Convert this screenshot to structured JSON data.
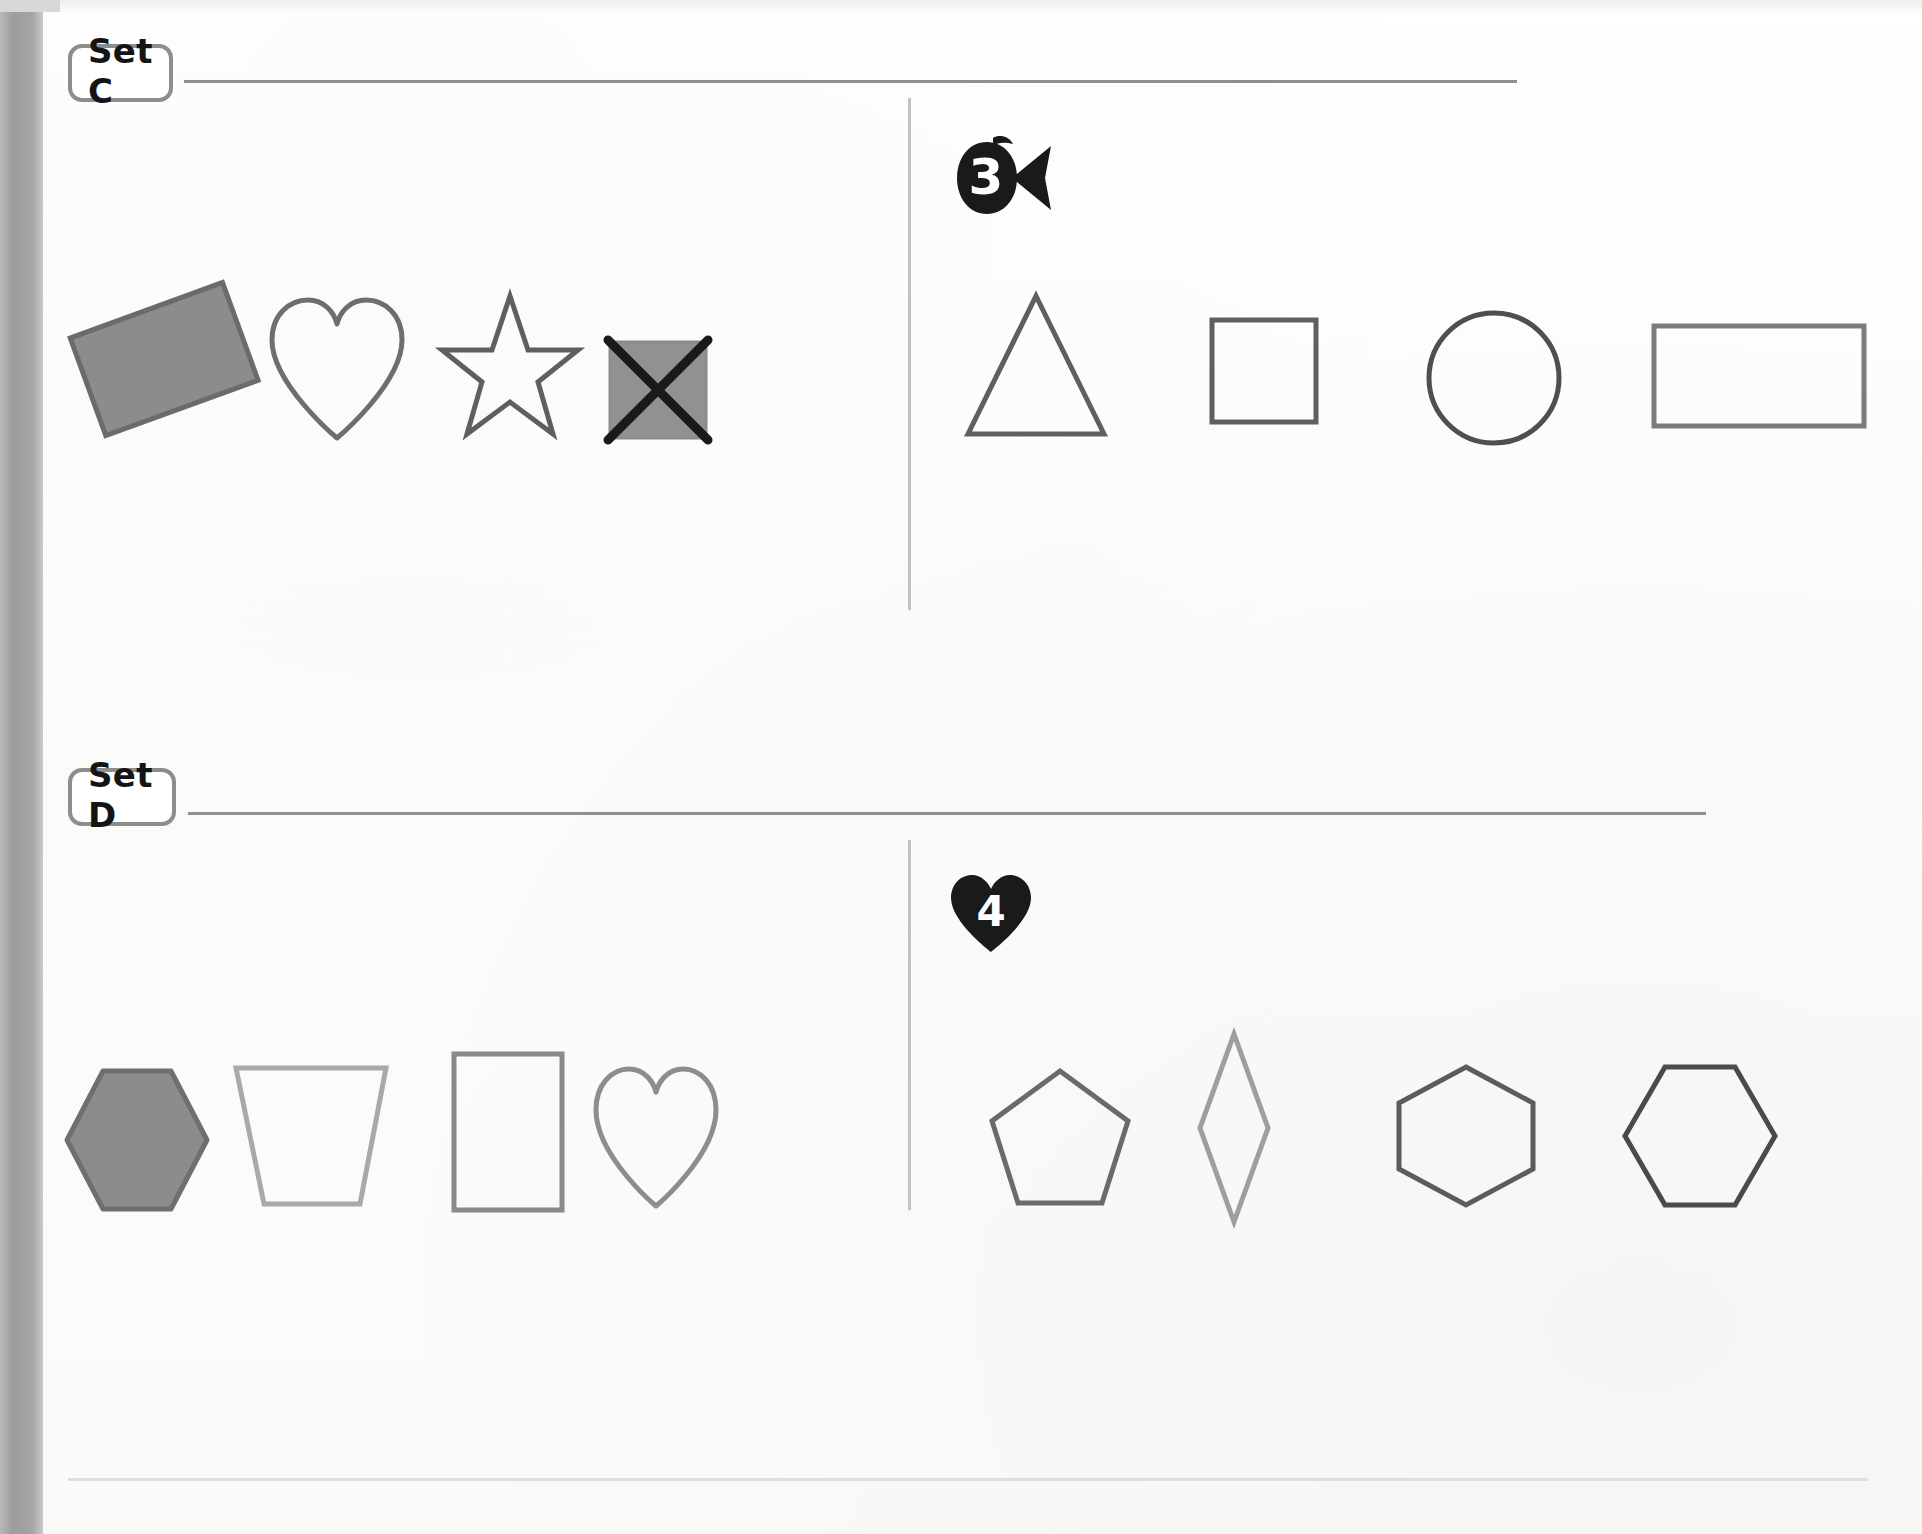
{
  "worksheet": {
    "background_color": "#fbfbfa",
    "ink_dark": "#555555",
    "ink_light": "#9a9a9a",
    "fill_gray": "#8c8c8c",
    "mark_black": "#1a1a1a",
    "rule_color": "#8f8f8f",
    "divider_color": "#c2c2c2"
  },
  "sets": [
    {
      "id": "set-c",
      "label": "Set C",
      "marker": {
        "number": "3",
        "icon": "fish-marker-icon",
        "shape": "fish"
      },
      "left_group": {
        "shapes": [
          {
            "name": "rectangle-tilted-filled",
            "label": "rectangle",
            "style": "filled",
            "rotation": -20,
            "stroke": "#6b6b6b",
            "fill": "#8c8c8c"
          },
          {
            "name": "heart-outline",
            "label": "heart",
            "style": "outline",
            "rotation": 0,
            "stroke": "#6e6e6e",
            "fill": "none"
          },
          {
            "name": "star-outline",
            "label": "star",
            "style": "outline",
            "rotation": 0,
            "stroke": "#5f5f5f",
            "fill": "none"
          },
          {
            "name": "square-filled-crossed",
            "label": "square",
            "style": "filled-crossed-out",
            "rotation": 0,
            "stroke": "#8c8c8c",
            "fill": "#919191"
          }
        ]
      },
      "right_group": {
        "shapes": [
          {
            "name": "triangle-outline",
            "label": "triangle",
            "style": "outline",
            "rotation": 0,
            "stroke": "#5f5f5f",
            "fill": "none"
          },
          {
            "name": "square-outline",
            "label": "square",
            "style": "outline",
            "rotation": 0,
            "stroke": "#5f5f5f",
            "fill": "none"
          },
          {
            "name": "circle-outline",
            "label": "circle",
            "style": "outline",
            "rotation": 0,
            "stroke": "#4f4f4f",
            "fill": "none"
          },
          {
            "name": "rectangle-outline",
            "label": "rectangle",
            "style": "outline",
            "rotation": 0,
            "stroke": "#7c7c7c",
            "fill": "none"
          }
        ]
      }
    },
    {
      "id": "set-d",
      "label": "Set D",
      "marker": {
        "number": "4",
        "icon": "heart-marker-icon",
        "shape": "heart"
      },
      "left_group": {
        "shapes": [
          {
            "name": "hexagon-filled",
            "label": "hexagon",
            "style": "filled",
            "rotation": 0,
            "stroke": "#6f6f6f",
            "fill": "#8c8c8c"
          },
          {
            "name": "trapezoid-outline",
            "label": "trapezoid",
            "style": "outline",
            "rotation": 0,
            "stroke": "#a9a9a9",
            "fill": "none"
          },
          {
            "name": "rectangle-outline",
            "label": "rectangle",
            "style": "outline",
            "rotation": 0,
            "stroke": "#8a8a8a",
            "fill": "none"
          },
          {
            "name": "heart-outline",
            "label": "heart",
            "style": "outline",
            "rotation": 0,
            "stroke": "#8d8d8d",
            "fill": "none"
          }
        ]
      },
      "right_group": {
        "shapes": [
          {
            "name": "pentagon-outline",
            "label": "pentagon",
            "style": "outline",
            "rotation": 0,
            "stroke": "#6a6a6a",
            "fill": "none"
          },
          {
            "name": "diamond-narrow-outline",
            "label": "diamond",
            "style": "outline",
            "rotation": 0,
            "stroke": "#9e9e9e",
            "fill": "none"
          },
          {
            "name": "hexagon-pointy-outline",
            "label": "hexagon",
            "style": "outline",
            "rotation": 0,
            "stroke": "#5c5c5c",
            "fill": "none"
          },
          {
            "name": "hexagon-flat-outline",
            "label": "hexagon",
            "style": "outline",
            "rotation": 0,
            "stroke": "#4a4a4a",
            "fill": "none"
          }
        ]
      }
    }
  ]
}
